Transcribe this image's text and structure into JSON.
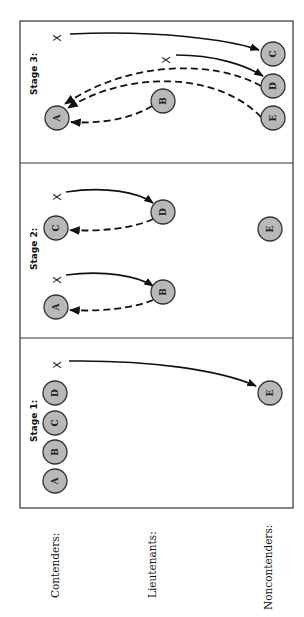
{
  "diagram": {
    "orientation": "rotated 90 degrees counter-clockwise",
    "row_labels": [
      "Contenders:",
      "Lieutenants:",
      "Noncontenders:"
    ],
    "stages": [
      {
        "label": "Stage 1:",
        "nodes": [
          {
            "id": "A",
            "role": "Contender"
          },
          {
            "id": "B",
            "role": "Contender"
          },
          {
            "id": "C",
            "role": "Contender"
          },
          {
            "id": "D",
            "role": "Contender"
          },
          {
            "id": "E",
            "role": "Noncontender"
          }
        ],
        "x_marks": [
          "X"
        ],
        "edges": [
          {
            "from": "X",
            "to": "E",
            "style": "solid"
          }
        ]
      },
      {
        "label": "Stage 2:",
        "nodes": [
          {
            "id": "A",
            "role": "Contender"
          },
          {
            "id": "C",
            "role": "Contender"
          },
          {
            "id": "B",
            "role": "Lieutenant"
          },
          {
            "id": "D",
            "role": "Lieutenant"
          },
          {
            "id": "E",
            "role": "Noncontender"
          }
        ],
        "x_marks": [
          "X",
          "X"
        ],
        "edges": [
          {
            "from": "X",
            "to": "B",
            "style": "solid"
          },
          {
            "from": "B",
            "to": "A",
            "style": "dashed"
          },
          {
            "from": "X",
            "to": "D",
            "style": "solid"
          },
          {
            "from": "D",
            "to": "C",
            "style": "dashed"
          }
        ]
      },
      {
        "label": "Stage 3:",
        "nodes": [
          {
            "id": "A",
            "role": "Contender"
          },
          {
            "id": "B",
            "role": "Lieutenant"
          },
          {
            "id": "C",
            "role": "Noncontender"
          },
          {
            "id": "D",
            "role": "Noncontender"
          },
          {
            "id": "E",
            "role": "Noncontender"
          }
        ],
        "x_marks": [
          "X",
          "X"
        ],
        "edges": [
          {
            "from": "X",
            "to": "C",
            "style": "solid"
          },
          {
            "from": "X",
            "to": "D",
            "style": "solid"
          },
          {
            "from": "B",
            "to": "A",
            "style": "dashed"
          },
          {
            "from": "D",
            "to": "A",
            "style": "dashed"
          },
          {
            "from": "E",
            "to": "A",
            "style": "dashed"
          }
        ]
      }
    ]
  }
}
